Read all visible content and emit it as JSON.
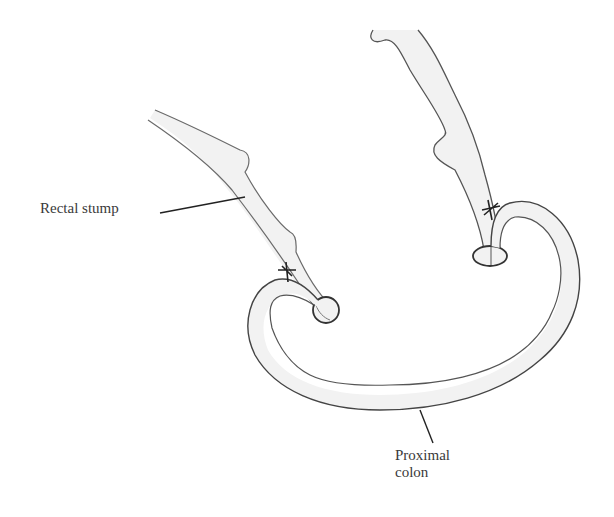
{
  "diagram": {
    "type": "anatomical illustration",
    "labels": {
      "rectal_stump": "Rectal stump",
      "proximal_colon_line1": "Proximal",
      "proximal_colon_line2": "colon"
    },
    "structures": [
      {
        "name": "rectal-stump",
        "description": "Tubular stump descending from upper-left, ending in a closed circular end"
      },
      {
        "name": "proximal-colon",
        "description": "Curved U-shaped colon loop connecting both ends"
      },
      {
        "name": "upper-bowel-segment",
        "description": "Tube descending from top-right, ending in a stapled oval end"
      }
    ],
    "colors": {
      "stroke": "#4a4a4a",
      "fill": "#f2f2f2",
      "leader": "#222222",
      "text": "#3a3a3a"
    }
  }
}
